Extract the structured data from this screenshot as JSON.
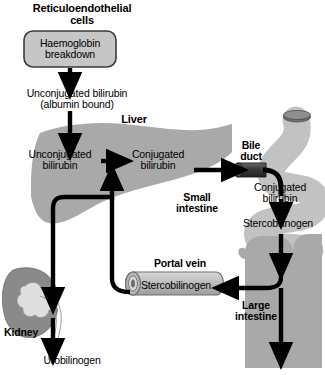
{
  "diagram": {
    "title_text": "Bilirubin metabolism pathway",
    "colors": {
      "background": "#ffffff",
      "organ_mid_gray": "#a9a9a9",
      "organ_light_gray": "#c2c2c2",
      "organ_dark_gray": "#8a8a8a",
      "box_fill": "#c6c6c6",
      "duct_dark": "#3a3a3a",
      "stroke": "#000000",
      "text": "#000000"
    },
    "labels": {
      "reticuloendothelial_cells": "Reticuloendothelial\ncells",
      "haemoglobin_breakdown": "Haemoglobin\nbreakdown",
      "unconjugated_bilirubin_albumin": "Unconjugated bilirubin\n(albumin bound)",
      "liver": "Liver",
      "unconjugated_bilirubin_liver": "Unconjugated\nbilirubin",
      "conjugated_bilirubin_liver": "Conjugated\nbilirubin",
      "bile_duct": "Bile\nduct",
      "conjugated_bilirubin_intestine": "Conjugated\nbilirubin",
      "small_intestine": "Small\nintestine",
      "stercobilinogen_intestine": "Stercobilinogen",
      "portal_vein": "Portal vein",
      "stercobilinogen_portal": "Stercobilinogen",
      "large_intestine": "Large\nintestine",
      "kidney": "Kidney",
      "urobilinogen": "Urobilinogen"
    },
    "nodes": [
      {
        "id": "haemoglobin-breakdown-box",
        "shape": "rounded-rect",
        "label": "Haemoglobin breakdown"
      },
      {
        "id": "liver-organ",
        "shape": "liver-silhouette",
        "label": "Liver"
      },
      {
        "id": "bile-duct",
        "shape": "cylinder",
        "label": "Bile duct"
      },
      {
        "id": "small-intestine-organ",
        "shape": "coiled-tube",
        "label": "Small intestine"
      },
      {
        "id": "large-intestine-organ",
        "shape": "colon-frame",
        "label": "Large intestine"
      },
      {
        "id": "portal-vein-cylinder",
        "shape": "horizontal-cylinder",
        "label": "Portal vein"
      },
      {
        "id": "kidney-organ",
        "shape": "bean",
        "label": "Kidney"
      }
    ],
    "flows": [
      {
        "from": "Haemoglobin breakdown",
        "to": "Unconjugated bilirubin (albumin bound)",
        "direction": "down"
      },
      {
        "from": "Unconjugated bilirubin (albumin bound)",
        "to": "Unconjugated bilirubin (liver)",
        "direction": "down"
      },
      {
        "from": "Unconjugated bilirubin (liver)",
        "to": "Conjugated bilirubin (liver)",
        "direction": "right"
      },
      {
        "from": "Conjugated bilirubin (liver)",
        "to": "Bile duct",
        "direction": "right"
      },
      {
        "from": "Bile duct",
        "to": "Conjugated bilirubin (small intestine)",
        "direction": "down"
      },
      {
        "from": "Conjugated bilirubin (small intestine)",
        "to": "Stercobilinogen (small intestine)",
        "direction": "down"
      },
      {
        "from": "Stercobilinogen (small intestine)",
        "to": "Large intestine",
        "direction": "down"
      },
      {
        "from": "Large intestine",
        "to": "Stercobilinogen (portal vein)",
        "direction": "left"
      },
      {
        "from": "Stercobilinogen (portal vein)",
        "to": "Unconjugated bilirubin (liver)",
        "direction": "up"
      },
      {
        "from": "Stercobilinogen (portal vein)",
        "to": "Kidney",
        "direction": "left-down"
      },
      {
        "from": "Kidney",
        "to": "Urobilinogen",
        "direction": "down"
      },
      {
        "from": "Large intestine",
        "to": "faeces (off-diagram)",
        "direction": "down"
      }
    ]
  }
}
